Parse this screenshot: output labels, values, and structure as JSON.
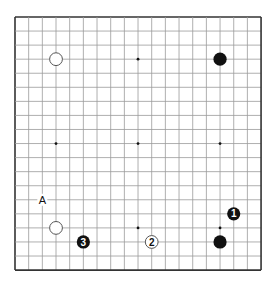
{
  "board": {
    "size": 19,
    "origin_x": 15,
    "origin_y": 17,
    "spacing_x": 13.67,
    "spacing_y": 14.06,
    "line_color": "#9a9a9a",
    "border_color": "#333333",
    "background": "#ffffff",
    "star_points": [
      [
        3,
        3
      ],
      [
        9,
        3
      ],
      [
        15,
        3
      ],
      [
        3,
        9
      ],
      [
        9,
        9
      ],
      [
        15,
        9
      ],
      [
        3,
        15
      ],
      [
        9,
        15
      ],
      [
        15,
        15
      ]
    ]
  },
  "stones": [
    {
      "color": "white",
      "col": 3,
      "row": 3,
      "label": ""
    },
    {
      "color": "black",
      "col": 15,
      "row": 3,
      "label": ""
    },
    {
      "color": "white",
      "col": 3,
      "row": 15,
      "label": ""
    },
    {
      "color": "black",
      "col": 15,
      "row": 16,
      "label": ""
    },
    {
      "color": "black",
      "col": 16,
      "row": 14,
      "label": "1"
    },
    {
      "color": "white",
      "col": 10,
      "row": 16,
      "label": "2"
    },
    {
      "color": "black",
      "col": 5,
      "row": 16,
      "label": "3"
    }
  ],
  "markers": [
    {
      "col": 2,
      "row": 13,
      "label": "A"
    }
  ],
  "colors": {
    "black_stone": "#111111",
    "white_stone_fill": "#ffffff",
    "white_stone_stroke": "#555555"
  }
}
